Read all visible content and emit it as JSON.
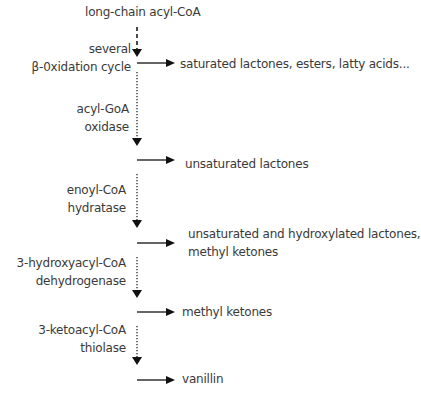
{
  "diagram": {
    "start": "long-chain acyl-CoA",
    "steps": [
      {
        "enzyme_line1": "several",
        "enzyme_line2": "β-0xidation cycle",
        "product": "saturated lactones, esters, latty acids...",
        "line_style": "dashed"
      },
      {
        "enzyme_line1": "acyl-GoA",
        "enzyme_line2": "oxidase",
        "product": "unsaturated lactones",
        "line_style": "dotted"
      },
      {
        "enzyme_line1": "enoyl-CoA",
        "enzyme_line2": "hydratase",
        "product_line1": "unsaturated and hydroxylated lactones,",
        "product_line2": "methyl ketones",
        "line_style": "dotted"
      },
      {
        "enzyme_line1": "3-hydroxyacyl-CoA",
        "enzyme_line2": "dehydrogenase",
        "product": "methyl ketones",
        "line_style": "dotted"
      },
      {
        "enzyme_line1": "3-ketoacyl-CoA",
        "enzyme_line2": "thiolase",
        "product": "vanillin",
        "line_style": "dotted"
      }
    ],
    "colors": {
      "text": "#3a3a3a",
      "arrow": "#111111",
      "background": "#ffffff"
    }
  }
}
